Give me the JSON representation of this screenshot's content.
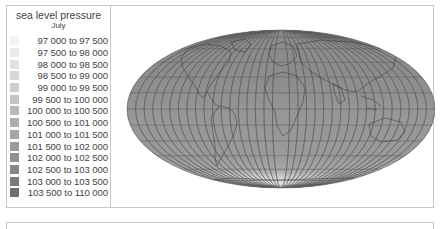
{
  "legend": {
    "title": "sea level pressure",
    "subtitle": "July",
    "items": [
      {
        "label": "97 000 to 97   500",
        "color": "#f3f3f3"
      },
      {
        "label": "97 500 to 98   000",
        "color": "#ebebeb"
      },
      {
        "label": "98 000 to 98   500",
        "color": "#e2e2e2"
      },
      {
        "label": "98 500 to 99   000",
        "color": "#d8d8d8"
      },
      {
        "label": "99 000 to 99   500",
        "color": "#cecece"
      },
      {
        "label": "99 500 to 100 000",
        "color": "#c4c4c4"
      },
      {
        "label": "100 000 to 100 500",
        "color": "#b9b9b9"
      },
      {
        "label": "100 500 to 101 000",
        "color": "#afafaf"
      },
      {
        "label": "101 000 to 101 500",
        "color": "#a5a5a5"
      },
      {
        "label": "101 500 to 102 000",
        "color": "#9b9b9b"
      },
      {
        "label": "102 000 to 102 500",
        "color": "#919191"
      },
      {
        "label": "102 500 to 103 000",
        "color": "#878787"
      },
      {
        "label": "103 000 to 103 500",
        "color": "#7c7c7c"
      },
      {
        "label": "103 500 to 110 000",
        "color": "#6e6e6e"
      }
    ]
  },
  "map": {
    "projection": "mollweide",
    "base_color": "#939393",
    "graticule_color": "#555555",
    "coast_color": "#3a3a3a"
  }
}
